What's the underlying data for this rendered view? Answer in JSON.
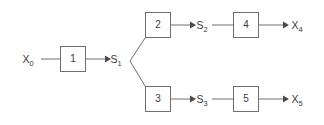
{
  "diagram": {
    "background_color": "#ffffff",
    "line_color": "#6e6e6e",
    "text_color": "#3a3a3a",
    "blocks": [
      {
        "id": "block-1",
        "label": "1",
        "x": 60,
        "y": 46,
        "w": 26,
        "h": 26
      },
      {
        "id": "block-2",
        "label": "2",
        "x": 145,
        "y": 12,
        "w": 26,
        "h": 26
      },
      {
        "id": "block-3",
        "label": "3",
        "x": 145,
        "y": 86,
        "w": 26,
        "h": 26
      },
      {
        "id": "block-4",
        "label": "4",
        "x": 233,
        "y": 12,
        "w": 26,
        "h": 26
      },
      {
        "id": "block-5",
        "label": "5",
        "x": 233,
        "y": 86,
        "w": 26,
        "h": 26
      }
    ],
    "signals": [
      {
        "id": "signal-x0",
        "base": "X",
        "subscript": "0",
        "x": 28,
        "y": 63
      },
      {
        "id": "signal-s1",
        "base": "S",
        "subscript": "1",
        "x": 116,
        "y": 63
      },
      {
        "id": "signal-s2",
        "base": "S",
        "subscript": "2",
        "x": 202,
        "y": 29
      },
      {
        "id": "signal-x4",
        "base": "X",
        "subscript": "4",
        "x": 297,
        "y": 29
      },
      {
        "id": "signal-s3",
        "base": "S",
        "subscript": "3",
        "x": 202,
        "y": 103
      },
      {
        "id": "signal-x5",
        "base": "X",
        "subscript": "5",
        "x": 297,
        "y": 103
      }
    ],
    "connections": [
      {
        "id": "conn-x0-to-block1",
        "from": "signal-x0",
        "to": "block-1",
        "arrow": false
      },
      {
        "id": "conn-block1-to-s1",
        "from": "block-1",
        "to": "signal-s1",
        "arrow": true
      },
      {
        "id": "conn-s1-to-block2",
        "from": "signal-s1",
        "to": "block-2",
        "arrow": false
      },
      {
        "id": "conn-s1-to-block3",
        "from": "signal-s1",
        "to": "block-3",
        "arrow": false
      },
      {
        "id": "conn-block2-to-s2",
        "from": "block-2",
        "to": "signal-s2",
        "arrow": true
      },
      {
        "id": "conn-s2-to-block4",
        "from": "signal-s2",
        "to": "block-4",
        "arrow": false
      },
      {
        "id": "conn-block4-to-x4",
        "from": "block-4",
        "to": "signal-x4",
        "arrow": true
      },
      {
        "id": "conn-block3-to-s3",
        "from": "block-3",
        "to": "signal-s3",
        "arrow": true
      },
      {
        "id": "conn-s3-to-block5",
        "from": "signal-s3",
        "to": "block-5",
        "arrow": false
      },
      {
        "id": "conn-block5-to-x5",
        "from": "block-5",
        "to": "signal-x5",
        "arrow": true
      }
    ]
  }
}
